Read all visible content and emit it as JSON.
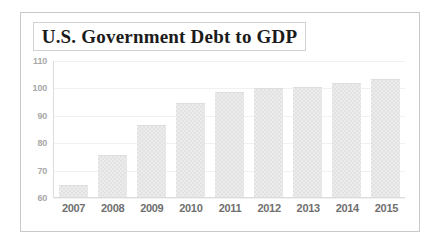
{
  "figure": {
    "title": "U.S. Government Debt to GDP",
    "border_color": "#c9c9c9",
    "background_color": "#ffffff"
  },
  "chart_data": {
    "type": "bar",
    "title": "U.S. Government Debt to GDP",
    "xlabel": "",
    "ylabel": "",
    "categories": [
      "2007",
      "2008",
      "2009",
      "2010",
      "2011",
      "2012",
      "2013",
      "2014",
      "2015"
    ],
    "values": [
      64.5,
      75.5,
      86.5,
      94.5,
      98.5,
      100,
      100.5,
      102,
      103.5
    ],
    "ylim": [
      60,
      110
    ],
    "yticks": [
      60,
      70,
      80,
      90,
      100,
      110
    ],
    "ytick_labels": [
      "60",
      "70",
      "80",
      "90",
      "100",
      "110"
    ],
    "grid": true,
    "legend": false,
    "bar_color": "#ececec",
    "gridline_color": "#f0f0f0",
    "tick_label_color": "#a8a8a8",
    "xtick_label_color": "#6f6f6f"
  }
}
